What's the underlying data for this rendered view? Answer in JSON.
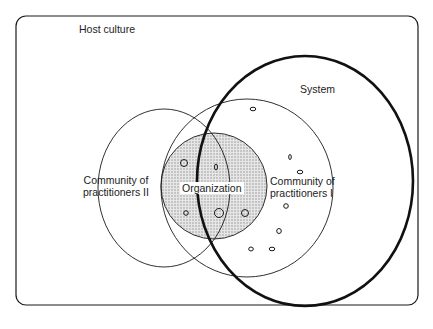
{
  "diagram": {
    "type": "nested-set-diagram",
    "frame_label": "Host culture",
    "sets": [
      {
        "id": "system",
        "label": "System",
        "style": "thick-outline"
      },
      {
        "id": "cop1",
        "label_line1": "Community of",
        "label_line2": "practitioners I",
        "style": "thin-outline"
      },
      {
        "id": "cop2",
        "label_line1": "Community of",
        "label_line2": "practitioners II",
        "style": "thin-outline"
      },
      {
        "id": "organization",
        "label": "Organization",
        "style": "shaded"
      }
    ],
    "colors": {
      "stroke": "#1a1a1a",
      "shade": "#d6d6d6",
      "background": "#ffffff"
    }
  }
}
